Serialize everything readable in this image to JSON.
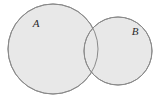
{
  "figure": {
    "type": "venn-diagram",
    "background_color": "#ffffff",
    "width": 158,
    "height": 99
  },
  "style": {
    "fill_color": "#e8e8e8",
    "stroke_color": "#8a8a8a",
    "stroke_width": 1,
    "label_color": "#2b2b2b",
    "label_font_size": 11
  },
  "sets": [
    {
      "id": "set-a",
      "label": "A",
      "center_x": 53,
      "center_y": 49,
      "radius": 45,
      "label_x": 36,
      "label_y": 27
    },
    {
      "id": "set-b",
      "label": "B",
      "center_x": 118,
      "center_y": 51,
      "radius": 34,
      "label_x": 135,
      "label_y": 35
    }
  ],
  "intersection": {
    "id": "intersection-ab",
    "label": "",
    "upper_point_x": 88,
    "upper_point_y": 20,
    "lower_point_x": 88,
    "lower_point_y": 80
  }
}
